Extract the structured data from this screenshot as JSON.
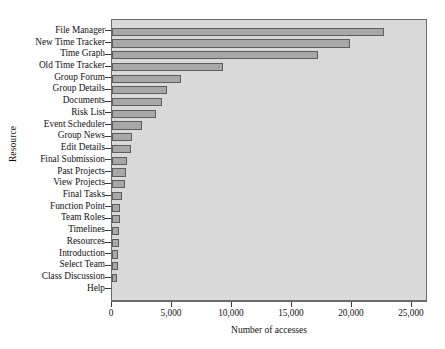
{
  "chart_data": {
    "type": "bar",
    "orientation": "horizontal",
    "title": "",
    "xlabel": "Number of accesses",
    "ylabel": "Resource",
    "xlim": [
      0,
      25000
    ],
    "ylim": null,
    "grid": false,
    "legend": null,
    "xticks": [
      0,
      5000,
      10000,
      15000,
      20000,
      25000
    ],
    "xticklabels": [
      "0",
      "5,000",
      "10,000",
      "15,000",
      "20,000",
      "25,000"
    ],
    "categories": [
      "File Manager",
      "New Time Tracker",
      "Time Graph",
      "Old Time Tracker",
      "Group Forum",
      "Group Details",
      "Documents",
      "Risk List",
      "Event Scheduler",
      "Group News",
      "Edit Details",
      "Final Submission",
      "Past Projects",
      "View Projects",
      "Final Tasks",
      "Function Point",
      "Team Roles",
      "Timelines",
      "Resources",
      "Introduction",
      "Select Team",
      "Class Discussion",
      "Help"
    ],
    "values": [
      22670,
      19830,
      17170,
      9250,
      5750,
      4550,
      4200,
      3700,
      2500,
      1700,
      1550,
      1250,
      1200,
      1100,
      850,
      700,
      680,
      600,
      560,
      520,
      480,
      450,
      0
    ],
    "bar_fill_color": "#a8a8a8",
    "bar_edge_color": "#5d5d5d",
    "plot_background_color": "#d9d9d9",
    "figure_background_color": "#ffffff",
    "axis_color": "#6b6b6b"
  }
}
